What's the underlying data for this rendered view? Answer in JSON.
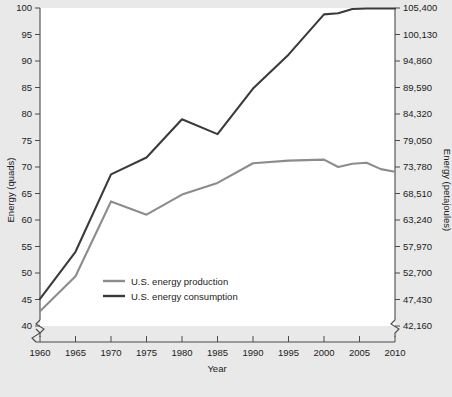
{
  "chart_data": {
    "type": "line",
    "title": "",
    "xlabel": "Year",
    "ylabel": "Energy (quads)",
    "ylabel_right": "Energy (petajoules)",
    "xlim": [
      1960,
      2010
    ],
    "ylim": [
      40,
      100
    ],
    "ylim_right": [
      42160,
      105400
    ],
    "grid": false,
    "legend_position": "lower-left-inside",
    "axis_break_left": true,
    "axis_break_bottom_right": true,
    "xticks": [
      1960,
      1965,
      1970,
      1975,
      1980,
      1985,
      1990,
      1995,
      2000,
      2005,
      2010
    ],
    "xtick_labels": [
      "1960",
      "1965",
      "1970",
      "1975",
      "1980",
      "1985",
      "1990",
      "1995",
      "2000",
      "2005",
      "2010"
    ],
    "yticks": [
      40,
      45,
      50,
      55,
      60,
      65,
      70,
      75,
      80,
      85,
      90,
      95,
      100
    ],
    "ytick_labels": [
      "40",
      "45",
      "50",
      "55",
      "60",
      "65",
      "70",
      "75",
      "80",
      "85",
      "90",
      "95",
      "100"
    ],
    "yticks_right": [
      42160,
      47430,
      52700,
      57970,
      63240,
      68510,
      73780,
      79050,
      84320,
      89590,
      94860,
      100130,
      105400
    ],
    "ytick_labels_right": [
      "42,160",
      "47,430",
      "52,700",
      "57,970",
      "63,240",
      "68,510",
      "73,780",
      "79,050",
      "84,320",
      "89,590",
      "94,860",
      "100,130",
      "105,400"
    ],
    "x": [
      1960,
      1965,
      1970,
      1975,
      1980,
      1985,
      1990,
      1995,
      2000,
      2002,
      2004,
      2006,
      2008,
      2010
    ],
    "series": [
      {
        "name": "U.S. energy production",
        "color": "#8c8c8c",
        "values": [
          42.8,
          49.4,
          63.5,
          61.0,
          64.8,
          67.0,
          70.7,
          71.2,
          71.4,
          70.0,
          70.6,
          70.8,
          69.6,
          69.1
        ]
      },
      {
        "name": "U.S. energy consumption",
        "color": "#3b3b3b",
        "values": [
          45.1,
          54.0,
          68.6,
          71.8,
          79.0,
          76.2,
          84.8,
          91.2,
          98.8,
          99.0,
          99.8,
          99.9,
          99.9,
          99.9
        ]
      }
    ]
  },
  "legend": {
    "items": [
      {
        "label": "U.S. energy production",
        "color": "#8c8c8c"
      },
      {
        "label": "U.S. energy consumption",
        "color": "#3b3b3b"
      }
    ]
  }
}
